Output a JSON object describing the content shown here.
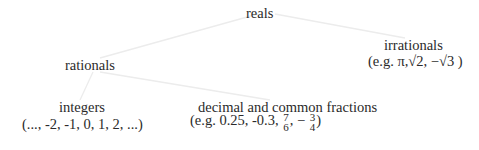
{
  "tree": {
    "root": {
      "label": "reals"
    },
    "irrationals": {
      "label": "irrationals",
      "examples": "(e.g. π,√2, −√3  )"
    },
    "rationals": {
      "label": "rationals"
    },
    "integers": {
      "label": "integers",
      "examples": "(..., -2, -1, 0, 1, 2, ...)"
    },
    "fractions": {
      "label": "decimal and common fractions",
      "examples_prefix": "(e.g. 0.25, -0.3, ",
      "frac1": {
        "num": "7",
        "den": "6"
      },
      "sep": ", − ",
      "frac2": {
        "num": "3",
        "den": "4"
      },
      "examples_suffix": ")"
    }
  },
  "edges": [
    [
      "reals",
      "rationals"
    ],
    [
      "reals",
      "irrationals"
    ],
    [
      "rationals",
      "integers"
    ],
    [
      "rationals",
      "decimal and common fractions"
    ]
  ],
  "colors": {
    "edge": "#ececec",
    "text": "#2a2a2a"
  }
}
